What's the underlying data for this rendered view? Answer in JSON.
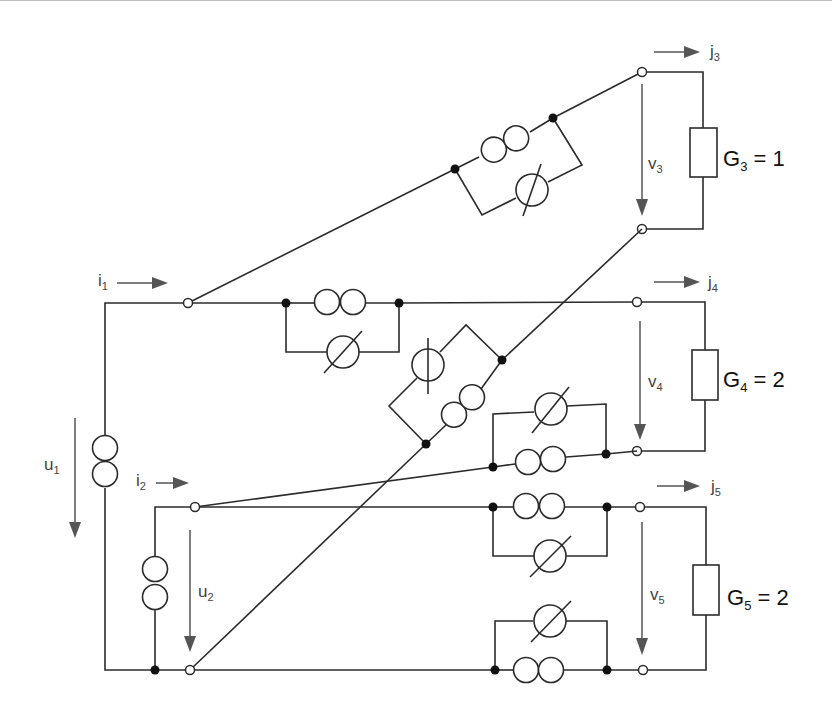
{
  "diagram": {
    "type": "circuit-schematic",
    "colors": {
      "wire": "#2b2b2b",
      "label": "#444444",
      "arrow": "#555555",
      "background": "#ffffff"
    },
    "ports": {
      "input1": {
        "current": "i",
        "current_sub": "1",
        "voltage": "u",
        "voltage_sub": "1"
      },
      "input2": {
        "current": "i",
        "current_sub": "2",
        "voltage": "u",
        "voltage_sub": "2"
      },
      "output3": {
        "current": "j",
        "current_sub": "3",
        "voltage": "v",
        "voltage_sub": "3"
      },
      "output4": {
        "current": "j",
        "current_sub": "4",
        "voltage": "v",
        "voltage_sub": "4"
      },
      "output5": {
        "current": "j",
        "current_sub": "5",
        "voltage": "v",
        "voltage_sub": "5"
      }
    },
    "loads": [
      {
        "name": "G",
        "sub": "3",
        "eq": " = 1"
      },
      {
        "name": "G",
        "sub": "4",
        "eq": " = 2"
      },
      {
        "name": "G",
        "sub": "5",
        "eq": " = 2"
      }
    ],
    "element_types": {
      "voltage_source": "double-circle (ideal voltage source)",
      "current_source": "circle with line (ideal current source)",
      "resistor": "rectangle (conductance)"
    },
    "branches": [
      {
        "id": "b1",
        "kind": "voltage_source",
        "location": "left vertical rail (port u1)"
      },
      {
        "id": "b2",
        "kind": "voltage_source",
        "location": "inner vertical (port u2)"
      },
      {
        "id": "b3a",
        "kind": "voltage_source",
        "location": "diagonal to j3, parallel with current source"
      },
      {
        "id": "b3b",
        "kind": "current_source",
        "location": "diagonal to j3"
      },
      {
        "id": "b4a",
        "kind": "voltage_source",
        "location": "horizontal i1 to j4"
      },
      {
        "id": "b4b",
        "kind": "current_source",
        "location": "horizontal i1 to j4"
      },
      {
        "id": "b5a",
        "kind": "voltage_source",
        "location": "diagonal from u2 bottom to v3 bottom"
      },
      {
        "id": "b5b",
        "kind": "current_source",
        "location": "diagonal from u2 bottom to v3 bottom"
      },
      {
        "id": "b6a",
        "kind": "voltage_source",
        "location": "i2 line to v4 bottom"
      },
      {
        "id": "b6b",
        "kind": "current_source",
        "location": "i2 line to v4 bottom"
      },
      {
        "id": "b7a",
        "kind": "voltage_source",
        "location": "i2 line to j5"
      },
      {
        "id": "b7b",
        "kind": "current_source",
        "location": "i2 line to j5"
      },
      {
        "id": "b8a",
        "kind": "voltage_source",
        "location": "bottom rail to v5 bottom"
      },
      {
        "id": "b8b",
        "kind": "current_source",
        "location": "bottom rail to v5 bottom"
      }
    ]
  }
}
